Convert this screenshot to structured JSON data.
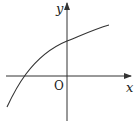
{
  "diagram": {
    "type": "function-graph",
    "x_axis_label": "x",
    "y_axis_label": "y",
    "origin_label": "O",
    "curve": "increasing concave-down curve crossing negative x-axis and positive y-axis",
    "colors": {
      "stroke": "#333333",
      "background": "#ffffff"
    }
  }
}
